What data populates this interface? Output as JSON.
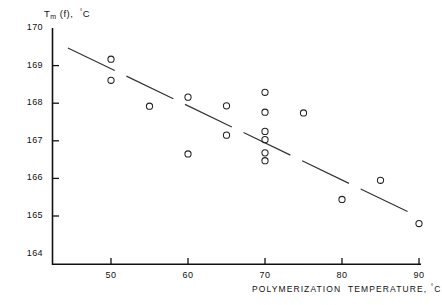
{
  "chart_data": {
    "type": "scatter",
    "title": "",
    "xlabel": "POLYMERIZATION TEMPERATURE, °C",
    "ylabel": "Tm(f), °C",
    "ylabel_main": "T",
    "ylabel_sub": "m",
    "ylabel_rest": "(f),",
    "ylabel_unit": "°C",
    "xlim": [
      45,
      90
    ],
    "ylim": [
      164,
      170
    ],
    "xticks": [
      50,
      60,
      70,
      80,
      90
    ],
    "xticklabels": [
      "50",
      "60",
      "70",
      "80",
      "90"
    ],
    "yticks": [
      164,
      165,
      166,
      167,
      168,
      169,
      170
    ],
    "yticklabels": [
      "164",
      "165",
      "166",
      "167",
      "168",
      "169",
      "170"
    ],
    "grid": false,
    "legend": null,
    "marker": "open-circle",
    "marker_color": "#222222",
    "points": [
      {
        "x": 50,
        "y": 169.17
      },
      {
        "x": 50,
        "y": 168.61
      },
      {
        "x": 55,
        "y": 167.92
      },
      {
        "x": 60,
        "y": 168.16
      },
      {
        "x": 60,
        "y": 166.65
      },
      {
        "x": 65,
        "y": 167.93
      },
      {
        "x": 65,
        "y": 167.15
      },
      {
        "x": 70,
        "y": 168.29
      },
      {
        "x": 70,
        "y": 167.76
      },
      {
        "x": 70,
        "y": 167.25
      },
      {
        "x": 70,
        "y": 167.03
      },
      {
        "x": 70,
        "y": 166.68
      },
      {
        "x": 70,
        "y": 166.47
      },
      {
        "x": 75,
        "y": 167.74
      },
      {
        "x": 80,
        "y": 165.44
      },
      {
        "x": 85,
        "y": 165.95
      },
      {
        "x": 90,
        "y": 164.8
      }
    ],
    "trendline": {
      "style": "dashed",
      "x_start": 44.4,
      "y_start": 169.47,
      "x_end": 89.5,
      "y_end": 165.02,
      "color": "#333333"
    }
  }
}
